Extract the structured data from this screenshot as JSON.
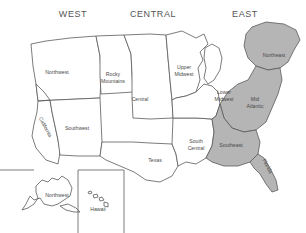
{
  "headers": [
    {
      "key": "west",
      "label": "WEST"
    },
    {
      "key": "central",
      "label": "CENTRAL"
    },
    {
      "key": "east",
      "label": "EAST"
    }
  ],
  "colors": {
    "background": "#ffffff",
    "land_fill": "#ffffff",
    "shaded_fill": "#b5b5b5",
    "outline": "#5a5a5a",
    "label_text": "#4a4a4a"
  },
  "regions": [
    {
      "key": "northwest",
      "label": "Northwest",
      "line1": "Northwest",
      "line2": "",
      "shaded": false,
      "x": 57,
      "y": 72,
      "rotation": 0
    },
    {
      "key": "california",
      "label": "California",
      "line1": "California",
      "line2": "",
      "shaded": false,
      "x": 44,
      "y": 128,
      "rotation": 62
    },
    {
      "key": "rocky-mountains",
      "label": "Rocky Mountains",
      "line1": "Rocky",
      "line2": "Mountains",
      "shaded": false,
      "x": 113,
      "y": 78,
      "rotation": 0
    },
    {
      "key": "southwest",
      "label": "Southwest",
      "line1": "Southwest",
      "line2": "",
      "shaded": false,
      "x": 77,
      "y": 128,
      "rotation": 0
    },
    {
      "key": "central",
      "label": "Central",
      "line1": "Central",
      "line2": "",
      "shaded": false,
      "x": 140,
      "y": 99,
      "rotation": 0
    },
    {
      "key": "upper-midwest",
      "label": "Upper Midwest",
      "line1": "Upper",
      "line2": "Midwest",
      "shaded": false,
      "x": 184,
      "y": 71,
      "rotation": 0
    },
    {
      "key": "texas",
      "label": "Texas",
      "line1": "Texas",
      "line2": "",
      "shaded": false,
      "x": 155,
      "y": 160,
      "rotation": 0
    },
    {
      "key": "south-central",
      "label": "South Central",
      "line1": "South",
      "line2": "Central",
      "shaded": false,
      "x": 196,
      "y": 145,
      "rotation": 0
    },
    {
      "key": "lower-midwest",
      "label": "Lower Midwest",
      "line1": "Lower",
      "line2": "Midwest",
      "shaded": false,
      "x": 224,
      "y": 96,
      "rotation": 0
    },
    {
      "key": "mid-atlantic",
      "label": "Mid Atlantic",
      "line1": "Mid",
      "line2": "Atlantic",
      "shaded": true,
      "x": 255,
      "y": 103,
      "rotation": 0
    },
    {
      "key": "northeast",
      "label": "Northeast",
      "line1": "Northeast",
      "line2": "",
      "shaded": true,
      "x": 274,
      "y": 55,
      "rotation": 0
    },
    {
      "key": "southeast",
      "label": "Southeast",
      "line1": "Southeast",
      "line2": "",
      "shaded": true,
      "x": 231,
      "y": 145,
      "rotation": 0
    },
    {
      "key": "florida",
      "label": "Florida",
      "line1": "Florida",
      "line2": "",
      "shaded": true,
      "x": 266,
      "y": 167,
      "rotation": 62
    }
  ],
  "insets": [
    {
      "key": "alaska",
      "label": "Northwest",
      "x": 57,
      "y": 197
    },
    {
      "key": "hawaii",
      "label": "Hawaii",
      "x": 98,
      "y": 211
    }
  ]
}
